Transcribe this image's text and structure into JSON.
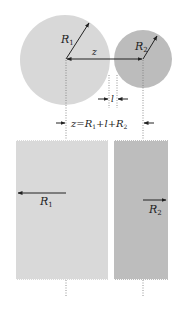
{
  "diagram": {
    "title": "",
    "spheres": {
      "sphere1": {
        "label": "R",
        "subscript": "1",
        "color": "#d8d8d8"
      },
      "sphere2": {
        "label": "R",
        "subscript": "2",
        "color": "#bcbcbc"
      }
    },
    "labels": {
      "center_distance": "z",
      "gap": "l",
      "formula": {
        "z": "z",
        "eq": "=",
        "r1": "R",
        "r1_sub": "1",
        "plus1": "+",
        "l": "l",
        "plus2": "+",
        "r2": "R",
        "r2_sub": "2"
      }
    },
    "slabs": {
      "slab1": {
        "label": "R",
        "subscript": "1",
        "color": "#d9d9d9"
      },
      "slab2": {
        "label": "R",
        "subscript": "2",
        "color": "#bdbdbd"
      }
    },
    "colors": {
      "line": "#222222",
      "dotted": "#777777",
      "background": "#ffffff"
    }
  }
}
